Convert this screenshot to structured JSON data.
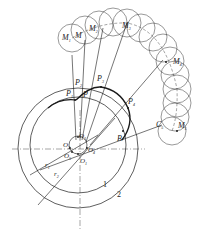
{
  "diagram": {
    "stroke_color": "#1a1a1a",
    "background": "#ffffff",
    "labels": {
      "m1": "M",
      "m1_sub": "1",
      "m": "M",
      "m2": "M",
      "m2_sub": "2",
      "m3": "M",
      "m3_sub": "3",
      "m4": "M",
      "m4_sub": "4",
      "m5": "M",
      "m5_sub": "5",
      "p": "P",
      "p1": "P",
      "p1_sub": "1",
      "p2": "P",
      "p2_sub": "2",
      "p3": "P",
      "p3_sub": "3",
      "p4": "P",
      "p4_sub": "4",
      "b": "B",
      "c5": "C",
      "c5_sub": "5",
      "o1": "O",
      "o1_sub": "1",
      "o2": "O",
      "o2_sub": "2",
      "o3": "O",
      "o3_sub": "3",
      "o4": "O",
      "o4_sub": "4",
      "o5": "O",
      "o5_sub": "5",
      "r1": "r",
      "r1_sub": "1",
      "r2": "r",
      "r2_sub": "2",
      "circle1": "1",
      "circle2": "2"
    },
    "rolling_circles": [
      {
        "cx": 72,
        "cy": 38
      },
      {
        "cx": 85,
        "cy": 30
      },
      {
        "cx": 99,
        "cy": 25
      },
      {
        "cx": 113,
        "cy": 22
      },
      {
        "cx": 127,
        "cy": 23
      },
      {
        "cx": 141,
        "cy": 28
      },
      {
        "cx": 153,
        "cy": 37
      },
      {
        "cx": 163,
        "cy": 48
      },
      {
        "cx": 170,
        "cy": 61
      },
      {
        "cx": 175,
        "cy": 75
      },
      {
        "cx": 177,
        "cy": 89
      },
      {
        "cx": 177,
        "cy": 103
      },
      {
        "cx": 175,
        "cy": 117
      },
      {
        "cx": 172,
        "cy": 131
      }
    ],
    "rolling_radius": 14
  }
}
